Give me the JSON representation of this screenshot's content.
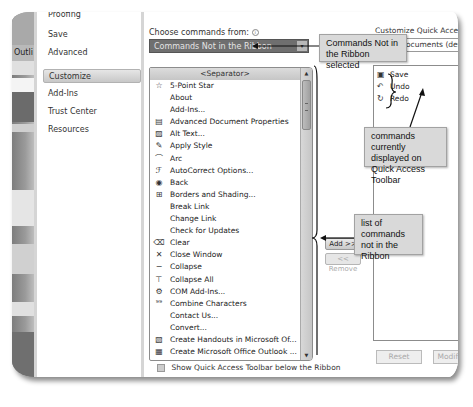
{
  "nav": {
    "partial_top": "Proofing",
    "items": [
      {
        "label": "Save",
        "active": false
      },
      {
        "label": "Advanced",
        "active": false
      },
      {
        "label": "Customize",
        "active": true
      },
      {
        "label": "Add-Ins",
        "active": false
      },
      {
        "label": "Trust Center",
        "active": false
      },
      {
        "label": "Resources",
        "active": false
      }
    ]
  },
  "background_window": {
    "partial_label": "Outli"
  },
  "choose_commands": {
    "label": "Choose commands from:",
    "info_icon": "i",
    "selected": "Commands Not in the Ribbon",
    "dropdown_arrow": "▾"
  },
  "commands": {
    "separator": "<Separator>",
    "items": [
      {
        "label": "5-Point Star",
        "icon": "star-icon",
        "glyph": "☆"
      },
      {
        "label": "About",
        "icon": "",
        "glyph": ""
      },
      {
        "label": "Add-Ins...",
        "icon": "",
        "glyph": ""
      },
      {
        "label": "Advanced Document Properties",
        "icon": "document-properties-icon",
        "glyph": "▤"
      },
      {
        "label": "Alt Text...",
        "icon": "alt-text-icon",
        "glyph": "▨"
      },
      {
        "label": "Apply Style",
        "icon": "apply-style-icon",
        "glyph": "✎"
      },
      {
        "label": "Arc",
        "icon": "arc-icon",
        "glyph": "⌒"
      },
      {
        "label": "AutoCorrect Options...",
        "icon": "autocorrect-icon",
        "glyph": "ℱ"
      },
      {
        "label": "Back",
        "icon": "back-icon",
        "glyph": "◉"
      },
      {
        "label": "Borders and Shading...",
        "icon": "borders-icon",
        "glyph": "⊞"
      },
      {
        "label": "Break Link",
        "icon": "",
        "glyph": ""
      },
      {
        "label": "Change Link",
        "icon": "",
        "glyph": ""
      },
      {
        "label": "Check for Updates",
        "icon": "",
        "glyph": ""
      },
      {
        "label": "Clear",
        "icon": "eraser-icon",
        "glyph": "⌫"
      },
      {
        "label": "Close Window",
        "icon": "close-icon",
        "glyph": "✕"
      },
      {
        "label": "Collapse",
        "icon": "collapse-icon",
        "glyph": "−"
      },
      {
        "label": "Collapse All",
        "icon": "collapse-all-icon",
        "glyph": "⊤"
      },
      {
        "label": "COM Add-Ins...",
        "icon": "com-addins-icon",
        "glyph": "⚙"
      },
      {
        "label": "Combine Characters",
        "icon": "combine-characters-icon",
        "glyph": "⁹⁹"
      },
      {
        "label": "Contact Us...",
        "icon": "",
        "glyph": ""
      },
      {
        "label": "Convert...",
        "icon": "",
        "glyph": ""
      },
      {
        "label": "Create Handouts in Microsoft Of...",
        "icon": "handouts-icon",
        "glyph": "▧"
      },
      {
        "label": "Create Microsoft Office Outlook ...",
        "icon": "outlook-icon",
        "glyph": "▦"
      },
      {
        "label": "Create Slide Show Dis...",
        "icon": "slideshow-icon",
        "glyph": "▭"
      }
    ]
  },
  "buttons": {
    "add": "Add >>",
    "remove": "<< Remove"
  },
  "qat": {
    "label": "Customize Quick Access Toolbar:",
    "combo_value": "For all documents (default)",
    "items": [
      {
        "label": "Save",
        "glyph": "▣"
      },
      {
        "label": "Undo",
        "glyph": "↶"
      },
      {
        "label": "Redo",
        "glyph": "↻"
      }
    ],
    "reset": "Reset",
    "modify": "Modify..."
  },
  "show_qat_below": {
    "label": "Show Quick Access Toolbar below the Ribbon",
    "checked": false
  },
  "callouts": {
    "combo": "Commands Not in the Ribbon selected",
    "list": "list of commands not in the Ribbon",
    "qat": "commands currently displayed on Quick Access Toolbar"
  }
}
